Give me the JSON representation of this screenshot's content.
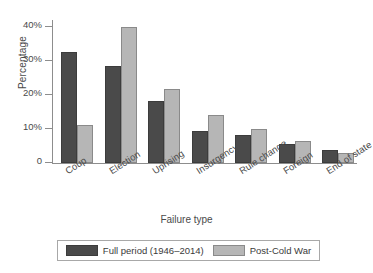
{
  "chart_data": {
    "type": "bar",
    "title": "",
    "xlabel": "Failure type",
    "ylabel": "Percentage",
    "categories": [
      "Coup",
      "Election",
      "Uprising",
      "Insurgency",
      "Rule change",
      "Foreign",
      "End of state"
    ],
    "series": [
      {
        "name": "Full period (1946–2014)",
        "color": "#4a4a4a",
        "values": [
          32.5,
          28.4,
          18.1,
          9.3,
          8.2,
          5.7,
          3.7
        ]
      },
      {
        "name": "Post-Cold War",
        "color": "#b6b6b6",
        "values": [
          11.3,
          40.0,
          21.7,
          14.0,
          9.9,
          6.5,
          2.8
        ]
      }
    ],
    "ylim": [
      0,
      42
    ],
    "yticks": [
      0,
      10,
      20,
      30,
      40
    ],
    "ytick_labels": [
      "0",
      "10%",
      "20%",
      "30%",
      "40%"
    ],
    "grid": false,
    "legend_position": "bottom"
  },
  "legend": {
    "entries": [
      {
        "label": "Full period (1946–2014)",
        "swatch": "dark"
      },
      {
        "label": "Post-Cold War",
        "swatch": "light"
      }
    ]
  }
}
